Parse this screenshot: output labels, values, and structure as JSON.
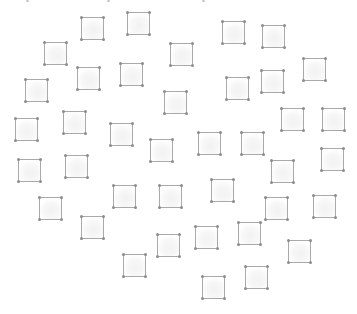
{
  "scene": {
    "width": 357,
    "height": 314,
    "background": "#ffffff",
    "node_size": 23,
    "node_border_color": "#a9a9a9",
    "corner_dot_color": "#8c8c8c",
    "edge_marks": [
      {
        "x": 26,
        "y": 0
      },
      {
        "x": 107,
        "y": 0
      },
      {
        "x": 202,
        "y": 0
      }
    ],
    "nodes": [
      {
        "x": 81,
        "y": 17
      },
      {
        "x": 127,
        "y": 12
      },
      {
        "x": 222,
        "y": 21
      },
      {
        "x": 262,
        "y": 25
      },
      {
        "x": 44,
        "y": 42
      },
      {
        "x": 170,
        "y": 43
      },
      {
        "x": 303,
        "y": 58
      },
      {
        "x": 77,
        "y": 67
      },
      {
        "x": 120,
        "y": 63
      },
      {
        "x": 261,
        "y": 70
      },
      {
        "x": 226,
        "y": 77
      },
      {
        "x": 25,
        "y": 79
      },
      {
        "x": 164,
        "y": 91
      },
      {
        "x": 281,
        "y": 108
      },
      {
        "x": 322,
        "y": 108
      },
      {
        "x": 63,
        "y": 111
      },
      {
        "x": 15,
        "y": 118
      },
      {
        "x": 110,
        "y": 123
      },
      {
        "x": 198,
        "y": 132
      },
      {
        "x": 241,
        "y": 132
      },
      {
        "x": 150,
        "y": 139
      },
      {
        "x": 321,
        "y": 148
      },
      {
        "x": 65,
        "y": 155
      },
      {
        "x": 18,
        "y": 159
      },
      {
        "x": 271,
        "y": 160
      },
      {
        "x": 211,
        "y": 179
      },
      {
        "x": 113,
        "y": 185
      },
      {
        "x": 159,
        "y": 185
      },
      {
        "x": 313,
        "y": 195
      },
      {
        "x": 39,
        "y": 197
      },
      {
        "x": 265,
        "y": 197
      },
      {
        "x": 81,
        "y": 216
      },
      {
        "x": 238,
        "y": 222
      },
      {
        "x": 195,
        "y": 226
      },
      {
        "x": 157,
        "y": 234
      },
      {
        "x": 288,
        "y": 240
      },
      {
        "x": 123,
        "y": 254
      },
      {
        "x": 245,
        "y": 266
      },
      {
        "x": 202,
        "y": 276
      }
    ]
  }
}
